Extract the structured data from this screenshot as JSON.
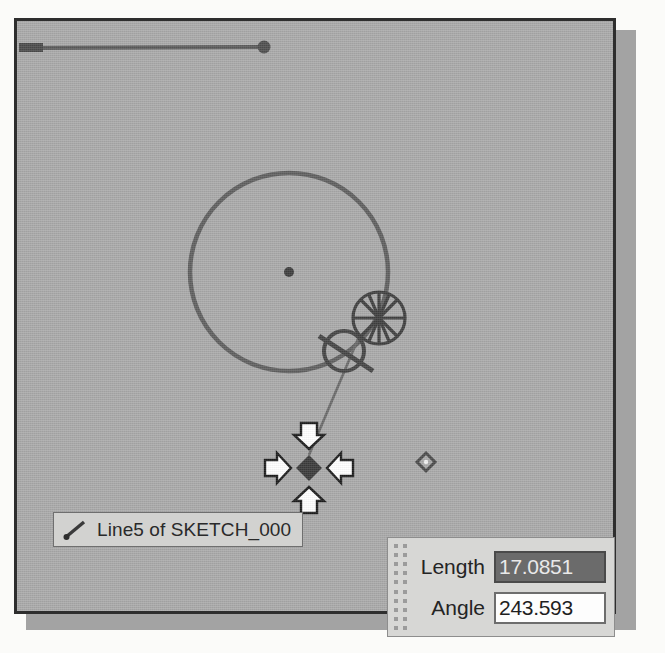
{
  "app": {
    "window_title": "",
    "canvas_background": "#a9a9a9",
    "border_color": "#2e2e2e"
  },
  "tooltip": {
    "icon": "line-tool-icon",
    "text": "Line5 of SKETCH_000"
  },
  "value_panel": {
    "grip": "drag-grip-dots",
    "rows": [
      {
        "label": "Length",
        "value": "17.0851",
        "selected": true
      },
      {
        "label": "Angle",
        "value": "243.593",
        "selected": false
      }
    ]
  },
  "sketch": {
    "entities": [
      {
        "name": "horizontal-line",
        "type": "line",
        "x1": 18,
        "y1": 47,
        "x2": 262,
        "y2": 46
      },
      {
        "name": "line-endpoint-dot",
        "type": "point",
        "x": 262,
        "y": 46
      },
      {
        "name": "line-startpoint",
        "type": "point",
        "x": 20,
        "y": 47
      },
      {
        "name": "main-circle",
        "type": "circle",
        "cx": 285,
        "cy": 267,
        "r": 99
      },
      {
        "name": "circle-center-point",
        "type": "point",
        "x": 285,
        "y": 267
      },
      {
        "name": "rubber-band-line",
        "type": "line",
        "x1": 355,
        "y1": 330,
        "x2": 305,
        "y2": 450
      },
      {
        "name": "free-point-marker",
        "type": "diamond",
        "x": 422,
        "y": 448
      }
    ],
    "constraints": [
      {
        "name": "tangent-constraint-glyph",
        "x": 344,
        "y": 342
      },
      {
        "name": "snap-to-point-cursor",
        "x": 375,
        "y": 312
      },
      {
        "name": "move-point-cursor",
        "x": 306,
        "y": 450
      }
    ]
  },
  "colors": {
    "sketch_geometry": "#5c5c5c",
    "canvas": "#a9a9a9",
    "panel_bg": "#d7d7d5",
    "selected_field_bg": "#6b6b6b",
    "text": "#242424"
  }
}
